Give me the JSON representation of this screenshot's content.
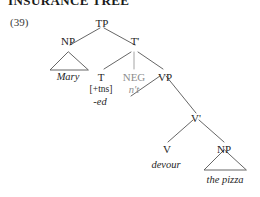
{
  "heading": {
    "text": "INSURANCE TREE"
  },
  "example": {
    "number": "(39)"
  },
  "tree": {
    "nodes": {
      "tp": "TP",
      "np_subject": "NP",
      "tbar": "T'",
      "t": "T",
      "neg": "NEG",
      "vp": "VP",
      "vbar": "V'",
      "v": "V",
      "np_object": "NP"
    },
    "features": {
      "tense": "[+tns]"
    },
    "lexical": {
      "subject": "Mary",
      "tense_affix": "-ed",
      "negation": "n't",
      "verb": "devour",
      "object": "the pizza"
    }
  },
  "colors": {
    "ink": "#242424",
    "grayed": "#8d8d8d",
    "line": "#555555",
    "background": "#ffffff"
  }
}
